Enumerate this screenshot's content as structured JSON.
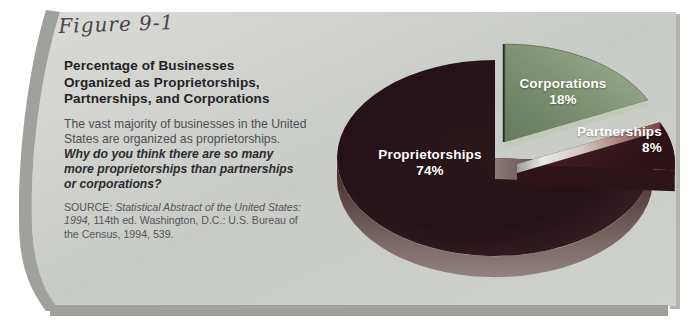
{
  "figure": {
    "label": "Figure 9-1"
  },
  "panel": {
    "title_lines": [
      "Percentage of Businesses",
      "Organized as Proprietorships,",
      "Partnerships, and Corporations"
    ],
    "description_lines": [
      "The vast majority of businesses in the United",
      "States are organized as proprietorships."
    ],
    "question_lines": [
      "Why do you think there are so many",
      "more proprietorships than partnerships",
      "or corporations?"
    ],
    "source_lines": [
      {
        "pre": "SOURCE: ",
        "italic": "Statistical Abstract of the United States:"
      },
      {
        "italic": "1994,",
        "rest": " 114th ed. Washington, D.C.: U.S. Bureau of"
      },
      {
        "rest": "the Census, 1994, 539."
      }
    ],
    "background_color": "#cdcfcb",
    "border_color": "#9fa19d"
  },
  "chart_data": {
    "type": "pie",
    "style": "3d-exploded",
    "title": "Percentage of Businesses Organized as Proprietorships, Partnerships, and Corporations",
    "start_angle_deg": 90,
    "direction": "clockwise",
    "legend": "none",
    "label_color": "#ffffff",
    "slices": [
      {
        "label": "Corporations",
        "value": 18,
        "display": "18%",
        "color": "#7d9070",
        "exploded": true
      },
      {
        "label": "Partnerships",
        "value": 8,
        "display": "8%",
        "color": "#47202a",
        "exploded": true
      },
      {
        "label": "Proprietorships",
        "value": 74,
        "display": "74%",
        "color": "#2b161c",
        "exploded": false
      }
    ]
  }
}
